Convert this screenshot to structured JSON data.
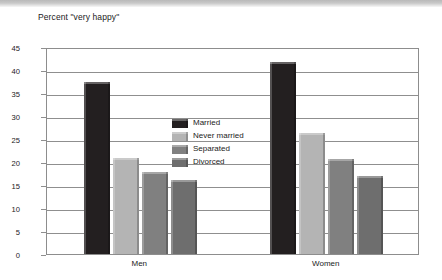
{
  "chart_data": {
    "type": "bar",
    "title": "Percent \"very happy\"",
    "subtitle": "",
    "xlabel": "",
    "ylabel": "",
    "categories": [
      "Men",
      "Women"
    ],
    "series": [
      {
        "name": "Married",
        "values": [
          37.3,
          41.7
        ],
        "color": "#231f20"
      },
      {
        "name": "Never married",
        "values": [
          20.9,
          26.2
        ],
        "color": "#b4b4b4"
      },
      {
        "name": "Separated",
        "values": [
          17.8,
          20.7
        ],
        "color": "#808080"
      },
      {
        "name": "Divorced",
        "values": [
          16.0,
          16.9
        ],
        "color": "#6e6e6e"
      }
    ],
    "ylim": [
      0,
      45
    ],
    "ytick_step": 5,
    "yticks": [
      "0",
      "5",
      "10",
      "15",
      "20",
      "25",
      "30",
      "35",
      "40",
      "45"
    ],
    "grid": true,
    "grid_axis": "y",
    "legend_position": "inside-upper-center",
    "plot_background": "#ffffff",
    "frame_color": "#8d8d8d",
    "gridline_color": "#8f8f8f",
    "text_color": "#1b1b1b"
  }
}
